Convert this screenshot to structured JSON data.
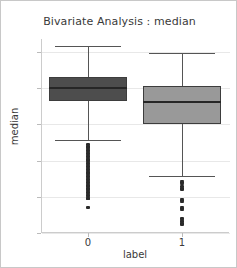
{
  "chart_data": {
    "type": "box",
    "title": "Bivariate Analysis : median",
    "xlabel": "label",
    "ylabel": "median",
    "categories": [
      "0",
      "1"
    ],
    "ylim": [
      0.0,
      0.268
    ],
    "yticks": [
      0.0,
      0.05,
      0.1,
      0.15,
      0.2,
      0.25
    ],
    "ytick_labels": [
      "0.00",
      "0.05",
      "0.10",
      "0.15",
      "0.20",
      "0.25"
    ],
    "grid": true,
    "legend": "none",
    "series": [
      {
        "name": "0",
        "color": "#4d4d4d",
        "q1": 0.182,
        "median": 0.2,
        "q3": 0.216,
        "whisker_low": 0.128,
        "whisker_high": 0.259,
        "outliers": [
          0.122,
          0.12,
          0.118,
          0.116,
          0.114,
          0.112,
          0.11,
          0.108,
          0.106,
          0.104,
          0.102,
          0.1,
          0.098,
          0.096,
          0.094,
          0.092,
          0.09,
          0.088,
          0.086,
          0.084,
          0.082,
          0.08,
          0.078,
          0.076,
          0.074,
          0.072,
          0.07,
          0.068,
          0.066,
          0.064,
          0.062,
          0.06,
          0.058,
          0.056,
          0.054,
          0.052,
          0.05,
          0.048,
          0.047,
          0.035
        ]
      },
      {
        "name": "1",
        "color": "#999999",
        "q1": 0.151,
        "median": 0.181,
        "q3": 0.203,
        "whisker_low": 0.079,
        "whisker_high": 0.248,
        "outliers": [
          0.072,
          0.07,
          0.068,
          0.064,
          0.062,
          0.06,
          0.047,
          0.045,
          0.043,
          0.036,
          0.034,
          0.032,
          0.02,
          0.018,
          0.016,
          0.013,
          0.012
        ]
      }
    ]
  }
}
